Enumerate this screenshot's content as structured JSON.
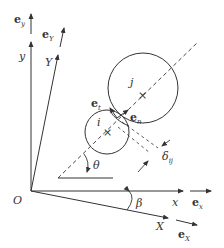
{
  "diagram": {
    "colors": {
      "stroke": "#333333",
      "background": "#ffffff"
    },
    "labels": {
      "origin": "O",
      "x_axis": "x",
      "y_axis": "y",
      "X_axis": "X",
      "Y_axis": "Y",
      "e_x": {
        "base": "e",
        "sub": "x"
      },
      "e_y": {
        "base": "e",
        "sub": "y"
      },
      "e_X": {
        "base": "e",
        "sub": "X"
      },
      "e_Y": {
        "base": "e",
        "sub": "Y"
      },
      "e_t": {
        "base": "e",
        "sub": "t"
      },
      "e_n": {
        "base": "e",
        "sub": "n"
      },
      "particle_i": "i",
      "particle_j": "j",
      "theta": "θ",
      "beta": "β",
      "delta": {
        "base": "δ",
        "sub": "ij"
      }
    },
    "icons": {
      "center_mark": "×"
    }
  }
}
